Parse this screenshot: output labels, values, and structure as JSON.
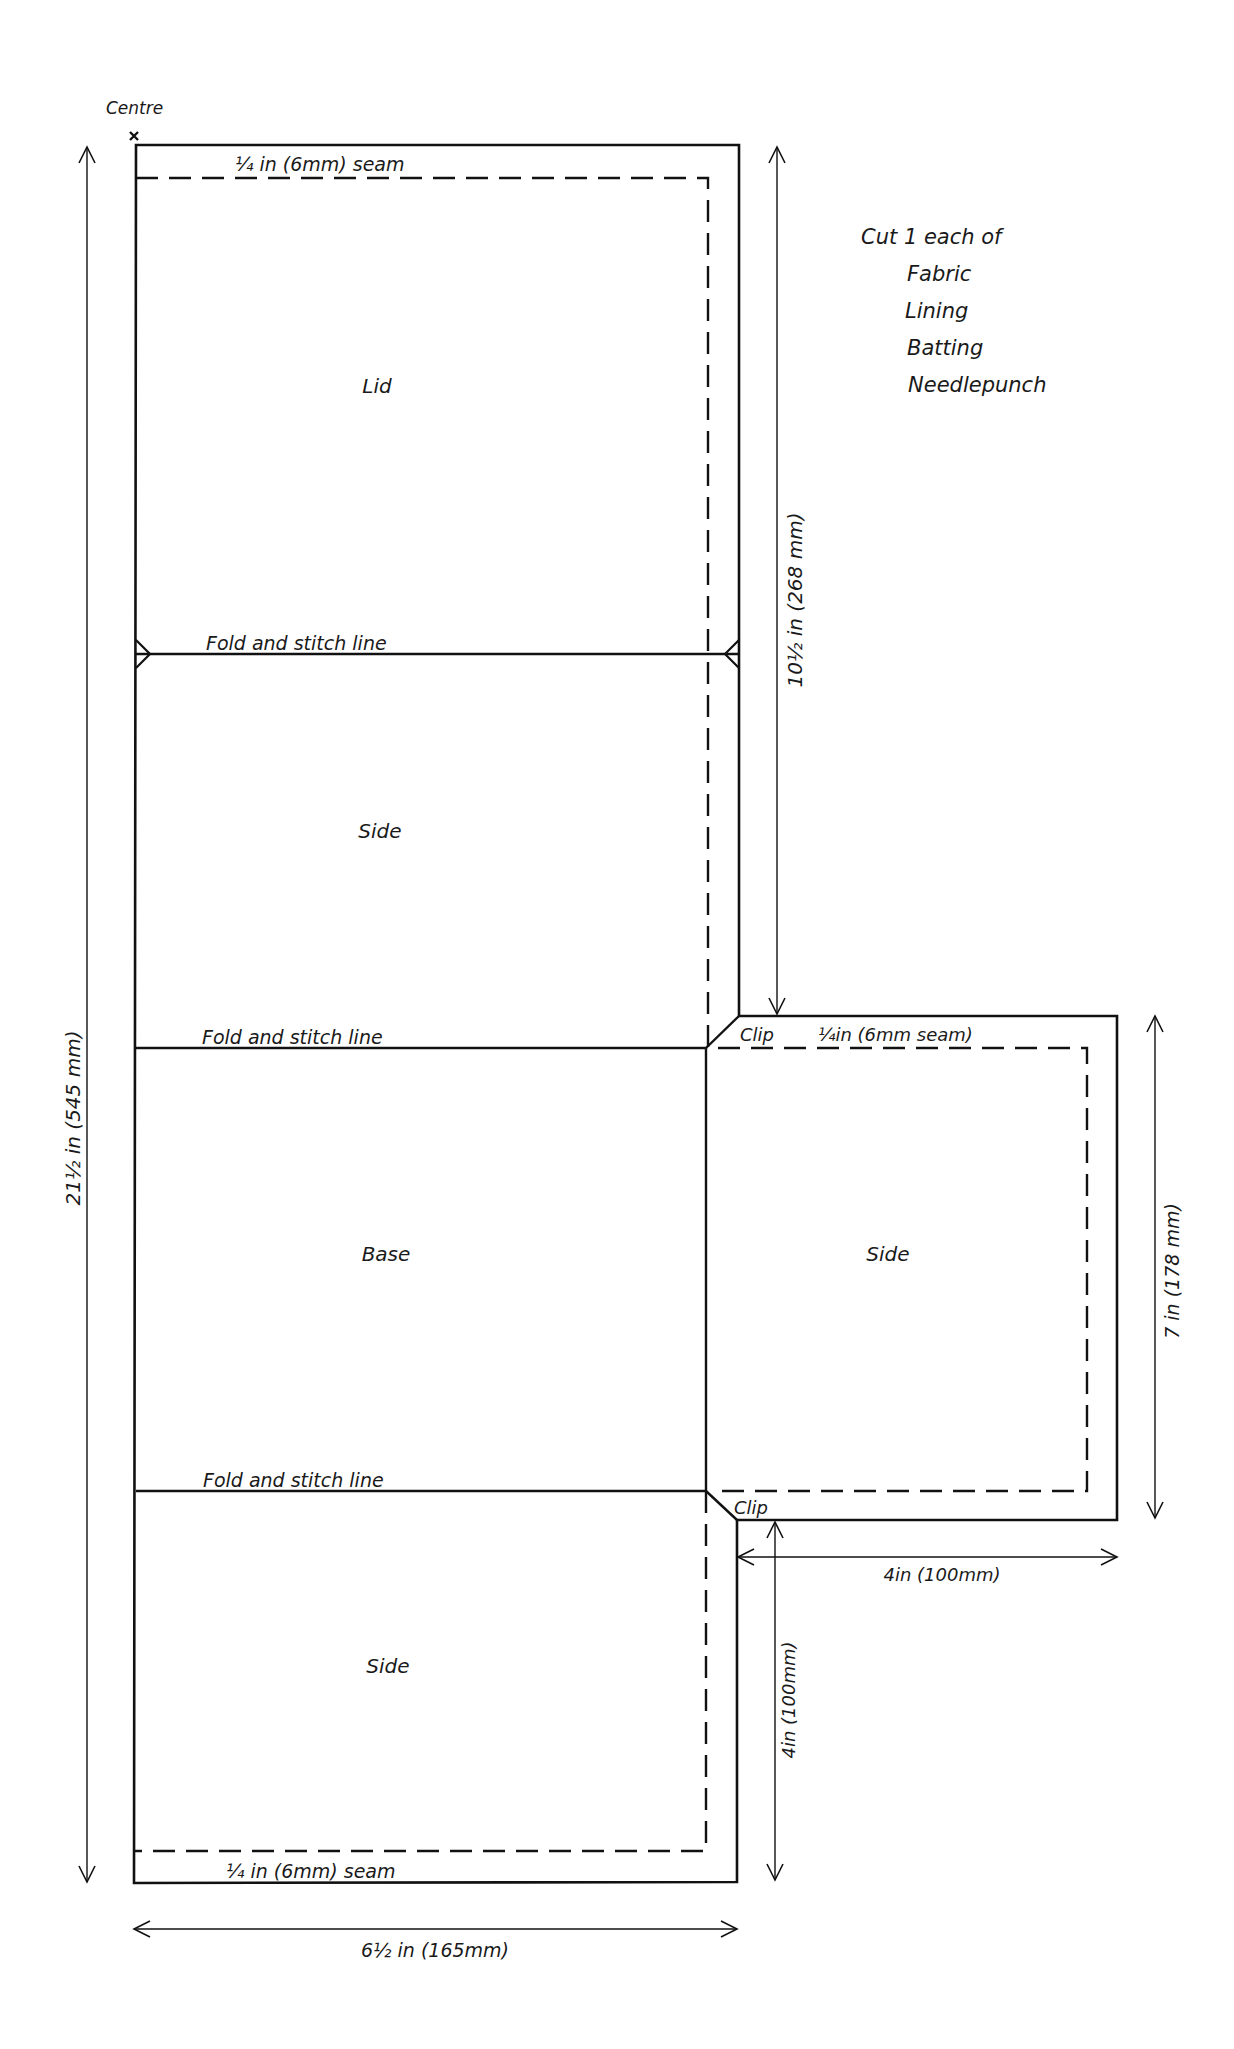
{
  "diagram": {
    "type": "sewing-pattern",
    "centre_label": "Centre",
    "panels": {
      "lid": "Lid",
      "side_top": "Side",
      "base": "Base",
      "side_bottom": "Side",
      "side_right": "Side"
    },
    "fold_lines": [
      "Fold and stitch line",
      "Fold and stitch line",
      "Fold and stitch line"
    ],
    "seam_labels": {
      "top": "¼ in (6mm) seam",
      "right_flap": "¼in (6mm seam)",
      "bottom": "¼ in (6mm) seam"
    },
    "clip_labels": [
      "Clip",
      "Clip"
    ],
    "dimensions": {
      "total_length": "21½ in (545 mm)",
      "upper_length": "10½ in (268 mm)",
      "flap_height": "7 in (178 mm)",
      "flap_width": "4in (100mm)",
      "lower_length": "4in (100mm)",
      "total_width": "6½ in (165mm)"
    },
    "instructions": {
      "heading": "Cut 1 each of",
      "items": [
        "Fabric",
        "Lining",
        "Batting",
        "Needlepunch"
      ]
    },
    "colors": {
      "line": "#111111",
      "background": "#ffffff"
    }
  }
}
